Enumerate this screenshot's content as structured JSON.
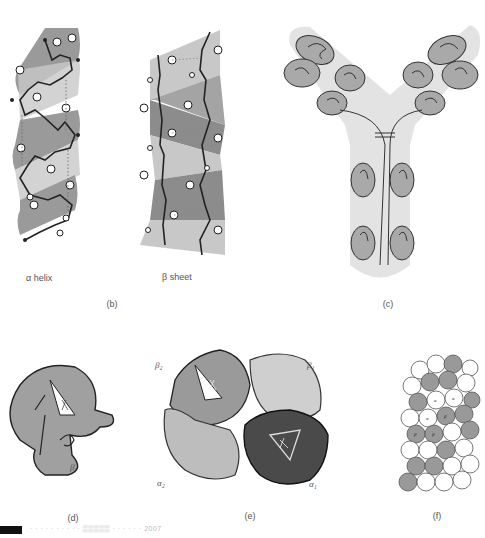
{
  "figure": {
    "panels": [
      {
        "id": "b",
        "label": "(b)",
        "sublabels": [
          "α helix",
          "β sheet"
        ]
      },
      {
        "id": "c",
        "label": "(c)",
        "description": "Y-shaped antibody domain schematic"
      },
      {
        "id": "d",
        "label": "(d)",
        "sublabels": [
          "β"
        ]
      },
      {
        "id": "e",
        "label": "(e)",
        "sublabels": [
          "β2",
          "β1",
          "α2",
          "α1"
        ]
      },
      {
        "id": "f",
        "label": "(f)",
        "sublabels": [
          "α",
          "β"
        ]
      }
    ],
    "helix_label": "α helix",
    "sheet_label": "β sheet",
    "panel_b_label": "(b)",
    "panel_c_label": "(c)",
    "panel_d_label": "(d)",
    "panel_e_label": "(e)",
    "panel_f_label": "(f)",
    "d_beta": "β",
    "e_beta2": "β₂",
    "e_beta1": "β₁",
    "e_alpha2": "α₂",
    "e_alpha1": "α₁",
    "f_alpha": "α",
    "f_beta": "β",
    "caption_text": "· · ·  ·  · ·  · · · ·  ▒▒▒▒▒  · ·  ·  ·  ·  ·  2007"
  },
  "colors": {
    "ribbon_dark": "#8c8c8c",
    "ribbon_light": "#c8c8c8",
    "antibody_fill": "#e3e3e3",
    "domain_fill": "#a9a9a9",
    "chain_dark": "#3a3a3a",
    "subunit_light": "#bdbdbd",
    "subunit_mid": "#9a9a9a",
    "subunit_dark": "#4a4a4a"
  }
}
